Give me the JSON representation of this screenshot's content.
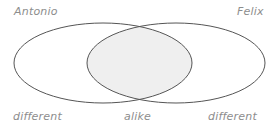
{
  "diagram": {
    "type": "venn",
    "title": "",
    "background_color": "#ffffff",
    "stroke_color": "#555555",
    "intersection_fill": "#efefef",
    "label_color": "#8d8d8d",
    "set_labels": {
      "left": "Antonio",
      "right": "Felix"
    },
    "region_labels": {
      "left_only": "different",
      "intersection": "alike",
      "right_only": "different"
    },
    "geometry": {
      "left_ellipse": {
        "cx": 103,
        "cy": 63,
        "rx": 89,
        "ry": 40
      },
      "right_ellipse": {
        "cx": 176,
        "cy": 63,
        "rx": 89,
        "ry": 40
      },
      "stroke_width": 1
    }
  }
}
